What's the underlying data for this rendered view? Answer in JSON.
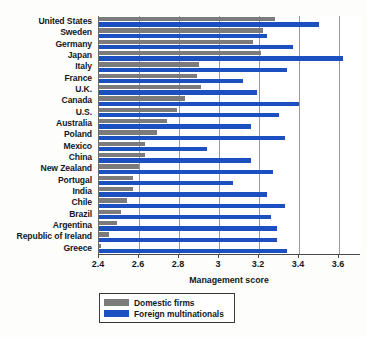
{
  "chart_data": {
    "type": "bar",
    "orientation": "horizontal",
    "title": "",
    "xlabel": "Management score",
    "ylabel": "",
    "xlim": [
      2.4,
      3.71
    ],
    "xticks": [
      2.4,
      2.6,
      2.8,
      3,
      3.2,
      3.4,
      3.6
    ],
    "xticklabels": [
      "2.4",
      "2.6",
      "2.8",
      "3",
      "3.2",
      "3.4",
      "3.6"
    ],
    "grid": "vertical",
    "legend_position": "below-axis-left",
    "categories": [
      "United States",
      "Sweden",
      "Germany",
      "Japan",
      "Italy",
      "France",
      "U.K.",
      "Canada",
      "U.S.",
      "Australia",
      "Poland",
      "Mexico",
      "China",
      "New Zealand",
      "Portugal",
      "India",
      "Chile",
      "Brazil",
      "Argentina",
      "Republic of Ireland",
      "Greece"
    ],
    "series": [
      {
        "name": "Domestic firms",
        "color": "#7b7b7b",
        "values": [
          3.28,
          3.22,
          3.17,
          3.21,
          2.9,
          2.89,
          2.91,
          2.83,
          2.79,
          2.74,
          2.69,
          2.63,
          2.63,
          2.6,
          2.57,
          2.57,
          2.54,
          2.51,
          2.49,
          2.45,
          2.41
        ]
      },
      {
        "name": "Foreign multinationals",
        "color": "#1c4fc0",
        "values": [
          3.5,
          3.24,
          3.37,
          3.62,
          3.34,
          3.12,
          3.19,
          3.4,
          3.3,
          3.16,
          3.33,
          2.94,
          3.16,
          3.27,
          3.07,
          3.24,
          3.33,
          3.26,
          3.29,
          3.29,
          3.34
        ]
      }
    ]
  },
  "legend": {
    "items": [
      {
        "label": "Domestic firms",
        "color": "#7b7b7b"
      },
      {
        "label": "Foreign multinationals",
        "color": "#1c4fc0"
      }
    ]
  }
}
